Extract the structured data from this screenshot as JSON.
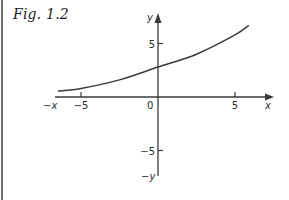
{
  "figure": {
    "label": "Fig. 1.2"
  },
  "chart_data": {
    "type": "line",
    "title": "",
    "xlabel": "x",
    "ylabel": "y",
    "x_neg_label": "−x",
    "y_neg_label": "−y",
    "origin_label": "0",
    "xlim": [
      -7,
      7
    ],
    "ylim": [
      -7.5,
      7.5
    ],
    "x_ticks": [
      {
        "value": -5,
        "label": "−5"
      },
      {
        "value": 5,
        "label": "5"
      }
    ],
    "y_ticks": [
      {
        "value": 5,
        "label": "5"
      },
      {
        "value": -5,
        "label": "−5"
      }
    ],
    "grid": false,
    "series": [
      {
        "name": "curve",
        "x": [
          -6.5,
          -5,
          -2.5,
          0,
          2.5,
          5,
          5.9
        ],
        "y": [
          0.55,
          0.8,
          1.6,
          2.8,
          4.0,
          5.8,
          6.7
        ]
      }
    ],
    "colors": {
      "line": "#3a3a3a",
      "axis": "#3a3a3a"
    }
  }
}
